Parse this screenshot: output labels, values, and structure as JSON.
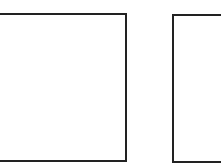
{
  "diagram": {
    "shapes": [
      {
        "type": "rectangle",
        "name": "left-square",
        "stroke": "#222222",
        "fill": "#ffffff"
      },
      {
        "type": "rectangle",
        "name": "right-square",
        "stroke": "#222222",
        "fill": "#ffffff"
      }
    ]
  }
}
